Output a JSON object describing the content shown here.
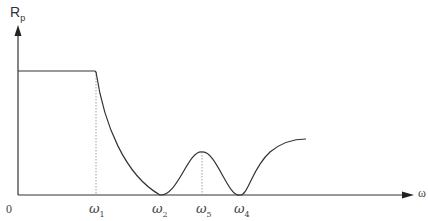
{
  "diagram": {
    "y_axis_label": "R",
    "y_axis_sub": "p",
    "x_axis_label": "ω",
    "origin_label": "0",
    "ticks": [
      {
        "sym": "ω",
        "sub": "1"
      },
      {
        "sym": "ω",
        "sub": "2"
      },
      {
        "sym": "ω",
        "sub": "5"
      },
      {
        "sym": "ω",
        "sub": "4"
      }
    ]
  }
}
